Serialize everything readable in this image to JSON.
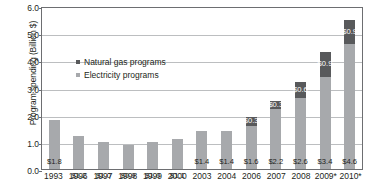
{
  "chart_data": {
    "type": "bar",
    "stacked": true,
    "title": "",
    "xlabel": "",
    "ylabel": "Program spending (Billion $)",
    "ylim": [
      0.0,
      6.0
    ],
    "yticks": [
      "0.0",
      "1.0",
      "2.0",
      "3.0",
      "4.0",
      "5.0",
      "6.0"
    ],
    "ytick_values": [
      0.0,
      1.0,
      2.0,
      3.0,
      4.0,
      5.0,
      6.0
    ],
    "grid": true,
    "legend_position": "upper-left-inside",
    "categories": [
      "1993",
      "1996",
      "1997",
      "1998",
      "1999",
      "2000",
      "2003",
      "2004",
      "2006",
      "2007",
      "2008",
      "2009*",
      "2010*"
    ],
    "series": [
      {
        "name": "Electricity programs",
        "color": "#a7a9ac",
        "values": [
          1.8,
          1.2,
          1.0,
          0.9,
          1.0,
          1.1,
          1.4,
          1.4,
          1.6,
          2.2,
          2.6,
          3.4,
          4.6
        ],
        "labels": [
          "$1.8",
          "$1.2",
          "$1.0",
          "$0.9",
          "$1.0",
          "$1.1",
          "$1.4",
          "$1.4",
          "$1.6",
          "$2.2",
          "$2.6",
          "$3.4",
          "$4.6"
        ]
      },
      {
        "name": "Natural gas programs",
        "color": "#58595b",
        "values": [
          0,
          0,
          0,
          0,
          0,
          0,
          0,
          0,
          0.3,
          0.3,
          0.6,
          0.9,
          0.9
        ],
        "labels": [
          "",
          "",
          "",
          "",
          "",
          "",
          "",
          "",
          "$0.3",
          "$0.3",
          "$0.6",
          "$0.9",
          "$0.9"
        ]
      }
    ],
    "totals": [
      1.8,
      1.2,
      1.0,
      0.9,
      1.0,
      1.1,
      1.4,
      1.4,
      1.9,
      2.5,
      3.2,
      4.3,
      5.5
    ]
  },
  "legend": {
    "entries": [
      {
        "label": "Natural gas programs",
        "color": "#58595b"
      },
      {
        "label": "Electricity programs",
        "color": "#a7a9ac"
      }
    ]
  }
}
